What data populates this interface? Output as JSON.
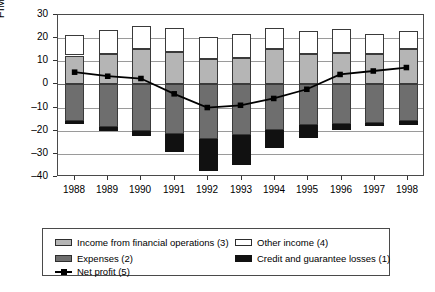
{
  "chart_data": {
    "type": "bar",
    "title": "",
    "subtitle": "",
    "xlabel": "",
    "ylabel": "FIM billion",
    "ylim": [
      -40,
      30
    ],
    "ytick_labels": [
      "30",
      "20",
      "10",
      "0",
      "-10",
      "-20",
      "-30",
      "-40"
    ],
    "ytick_values": [
      30,
      20,
      10,
      0,
      -10,
      -20,
      -30,
      -40
    ],
    "grid": true,
    "legend_position": "below-plot",
    "stacked": true,
    "categories": [
      "1988",
      "1989",
      "1990",
      "1991",
      "1992",
      "1993",
      "1994",
      "1995",
      "1996",
      "1997",
      "1998"
    ],
    "series": [
      {
        "name": "Income from financial operations (3)",
        "key": "income_financial_operations",
        "color": "#b5b5b5",
        "stack": "positive",
        "values": [
          12.5,
          13.0,
          15.2,
          14.0,
          11.0,
          11.5,
          15.5,
          13.0,
          13.5,
          13.0,
          15.5
        ]
      },
      {
        "name": "Other income (4)",
        "key": "other_income",
        "color": "#ffffff",
        "stack": "positive",
        "values": [
          9.0,
          10.5,
          10.2,
          10.3,
          9.5,
          10.5,
          9.0,
          10.0,
          10.5,
          9.0,
          7.5
        ]
      },
      {
        "name": "Expenses (2)",
        "key": "expenses",
        "color": "#6e6e6e",
        "stack": "negative",
        "values": [
          -16.0,
          -18.5,
          -20.0,
          -21.5,
          -23.5,
          -22.0,
          -19.5,
          -17.5,
          -17.0,
          -16.5,
          -16.0
        ]
      },
      {
        "name": "Credit and guarantee losses (1)",
        "key": "credit_guarantee_losses",
        "color": "#111111",
        "stack": "negative",
        "values": [
          -1.0,
          -1.5,
          -2.5,
          -7.5,
          -14.0,
          -13.0,
          -8.0,
          -5.5,
          -2.5,
          -1.5,
          -1.5
        ]
      },
      {
        "name": "Net profit (5)",
        "key": "net_profit",
        "color": "#000000",
        "type": "line",
        "marker": "square",
        "values": [
          5.0,
          3.2,
          2.2,
          -4.5,
          -10.5,
          -9.5,
          -6.5,
          -2.5,
          4.0,
          5.5,
          7.0
        ]
      }
    ]
  },
  "axis": {
    "y_title": "FIM billion"
  },
  "legend": {
    "items": [
      {
        "label": "Income from financial operations (3)",
        "swatch": "income-swatch"
      },
      {
        "label": "Other income (4)",
        "swatch": "other-income-swatch"
      },
      {
        "label": "Expenses (2)",
        "swatch": "expenses-swatch"
      },
      {
        "label": "Credit and guarantee losses (1)",
        "swatch": "losses-swatch"
      },
      {
        "label": "Net profit (5)",
        "swatch": "net-profit-line-swatch"
      }
    ]
  }
}
